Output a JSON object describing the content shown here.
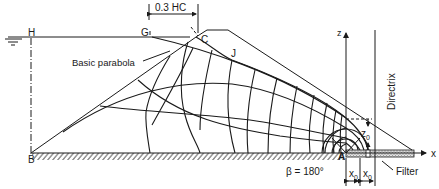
{
  "diagram": {
    "labels": {
      "H": "H",
      "G": "G",
      "C": "C",
      "J": "J",
      "B": "B",
      "A": "A",
      "z_axis": "z",
      "x_axis": "x",
      "dimension_top": "0.3 HC",
      "basic_parabola": "Basic parabola",
      "directrix": "Directrix",
      "z0": "z",
      "z0_sub": "0",
      "x0_left": "x",
      "x0_left_sub": "0",
      "x0_right": "x",
      "x0_right_sub": "0",
      "filter": "Filter",
      "beta": "β = 180°"
    },
    "colors": {
      "line": "#1a1a1a",
      "background": "#ffffff",
      "filter_fill": "#bdbdbd"
    }
  }
}
